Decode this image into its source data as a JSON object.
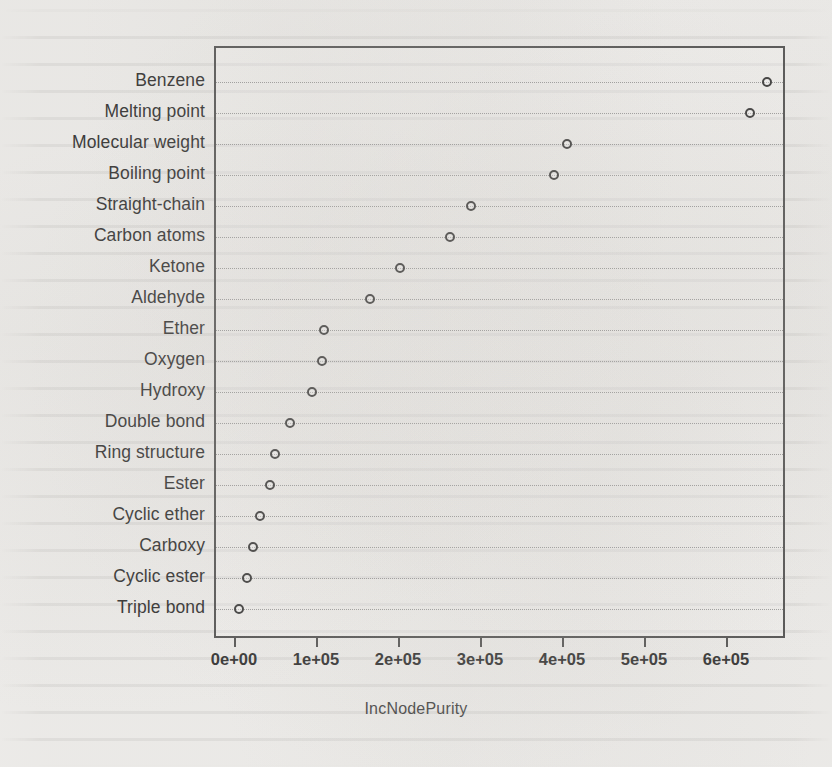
{
  "chart_data": {
    "type": "scatter",
    "title": "",
    "xlabel": "IncNodePurity",
    "ylabel": "",
    "orientation": "horizontal-dotplot",
    "grid": true,
    "legend": null,
    "xlim": [
      -16000,
      680000
    ],
    "xticks": [
      0,
      100000,
      200000,
      300000,
      400000,
      500000,
      600000
    ],
    "xticklabels": [
      "0e+00",
      "1e+05",
      "2e+05",
      "3e+05",
      "4e+05",
      "5e+05",
      "6e+05"
    ],
    "categories": [
      "Benzene",
      "Melting point",
      "Molecular weight",
      "Boiling point",
      "Straight-chain",
      "Carbon atoms",
      "Ketone",
      "Aldehyde",
      "Ether",
      "Oxygen",
      "Hydroxy",
      "Double bond",
      "Ring structure",
      "Ester",
      "Cyclic ether",
      "Carboxy",
      "Cyclic ester",
      "Triple bond"
    ],
    "values": [
      648000,
      627000,
      404000,
      388000,
      286000,
      261000,
      200000,
      163000,
      107000,
      105000,
      93000,
      66000,
      48000,
      41000,
      29000,
      21000,
      13000,
      4000
    ]
  },
  "axis": {
    "x_title": "IncNodePurity"
  }
}
